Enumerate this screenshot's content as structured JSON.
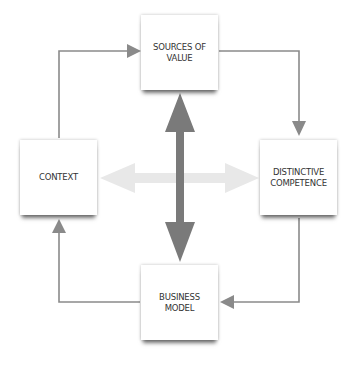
{
  "diagram": {
    "nodes": {
      "top": {
        "label": "SOURCES OF\nVALUE"
      },
      "left": {
        "label": "CONTEXT"
      },
      "right": {
        "label": "DISTINCTIVE\nCOMPETENCE"
      },
      "bottom": {
        "label": "BUSINESS\nMODEL"
      }
    },
    "edges": [
      {
        "from": "CONTEXT",
        "to": "SOURCES OF VALUE",
        "style": "thin-arrow"
      },
      {
        "from": "SOURCES OF VALUE",
        "to": "DISTINCTIVE COMPETENCE",
        "style": "thin-arrow"
      },
      {
        "from": "DISTINCTIVE COMPETENCE",
        "to": "BUSINESS MODEL",
        "style": "thin-arrow"
      },
      {
        "from": "BUSINESS MODEL",
        "to": "CONTEXT",
        "style": "thin-arrow"
      },
      {
        "from": "SOURCES OF VALUE",
        "to": "BUSINESS MODEL",
        "style": "thick-double-arrow"
      },
      {
        "from": "CONTEXT",
        "to": "DISTINCTIVE COMPETENCE",
        "style": "light-double-arrow"
      }
    ],
    "colors": {
      "thin_arrow": "#8a8a8a",
      "thick_arrow": "#7a7a7a",
      "light_arrow": "#e6e6e6",
      "text": "#333333"
    }
  }
}
